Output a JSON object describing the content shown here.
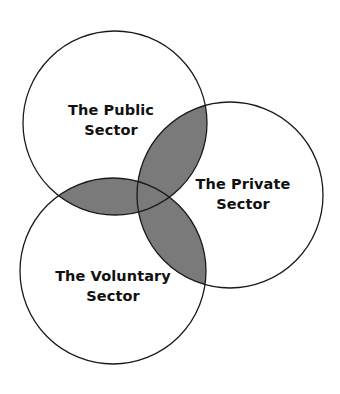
{
  "diagram": {
    "type": "venn",
    "colors": {
      "background": "#ffffff",
      "stroke": "#1a1a1a",
      "overlap_fill": "#7a7a7a",
      "text": "#111111"
    },
    "circles": [
      {
        "id": "public",
        "cx": 115,
        "cy": 123,
        "r": 92,
        "label_line1": "The Public",
        "label_line2": "Sector"
      },
      {
        "id": "private",
        "cx": 230,
        "cy": 195,
        "r": 93,
        "label_line1": "The Private",
        "label_line2": "Sector"
      },
      {
        "id": "voluntary",
        "cx": 113,
        "cy": 271,
        "r": 93,
        "label_line1": "The Voluntary",
        "label_line2": "Sector"
      }
    ],
    "overlaps_shaded": [
      "public∩private",
      "public∩voluntary",
      "private∩voluntary",
      "public∩private∩voluntary"
    ]
  }
}
